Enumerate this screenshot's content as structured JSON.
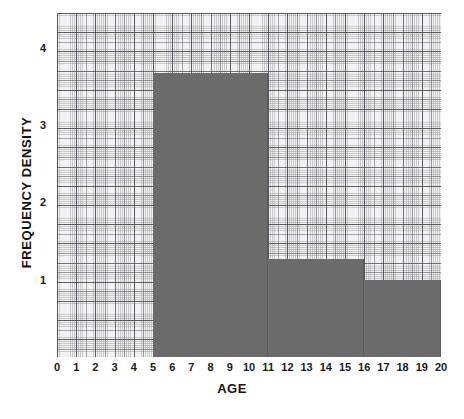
{
  "chart_data": {
    "type": "bar",
    "title": "",
    "subtitle": "",
    "xlabel": "AGE",
    "ylabel": "FREQUENCY DENSITY",
    "xlim": [
      0,
      20
    ],
    "ylim": [
      0,
      4.45
    ],
    "grid": "graph-paper",
    "legend": "none",
    "bar_color": "#6b6b6b",
    "background_color": "#f2f2f2",
    "xticks": [
      0,
      1,
      2,
      3,
      4,
      5,
      6,
      7,
      8,
      9,
      10,
      11,
      12,
      13,
      14,
      15,
      16,
      17,
      18,
      19,
      20
    ],
    "xtick_labels": [
      "0",
      "1",
      "2",
      "3",
      "4",
      "5",
      "6",
      "7",
      "8",
      "9",
      "10",
      "11",
      "12",
      "13",
      "14",
      "15",
      "16",
      "17",
      "18",
      "19",
      "20"
    ],
    "yticks": [
      1,
      2,
      3,
      4
    ],
    "ytick_labels": [
      "1",
      "2",
      "3",
      "4"
    ],
    "bins": [
      {
        "label": "5-11",
        "x_start": 5,
        "x_end": 11,
        "value": 3.68,
        "width": 6,
        "frequency": 22
      },
      {
        "label": "11-16",
        "x_start": 11,
        "x_end": 16,
        "value": 1.27,
        "width": 5,
        "frequency": 6
      },
      {
        "label": "16-20",
        "x_start": 16,
        "x_end": 20,
        "value": 1.0,
        "width": 4,
        "frequency": 4
      }
    ],
    "categories": [
      "5-11",
      "11-16",
      "16-20"
    ],
    "values": [
      3.68,
      1.27,
      1.0
    ]
  }
}
